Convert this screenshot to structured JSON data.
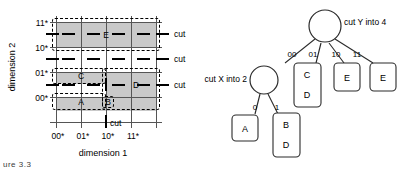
{
  "figure": {
    "caption_fragment": "ure 3.3"
  },
  "grid": {
    "ylabel": "dimension 2",
    "xlabel": "dimension 1",
    "yticks": [
      "11*",
      "10*",
      "01*",
      "00*"
    ],
    "xticks": [
      "00*",
      "01*",
      "10*",
      "11*"
    ],
    "regions": [
      {
        "letter": "E"
      },
      {
        "letter": "C"
      },
      {
        "letter": "A"
      },
      {
        "letter": "D"
      },
      {
        "letter": "B"
      }
    ],
    "cut_labels": {
      "right_top": "cut",
      "right_mid": "cut",
      "right_bottom": "cut",
      "bottom": "cut"
    },
    "colors": {
      "shade": "#c9c9c9",
      "gridline": "#555555",
      "ink": "#000000"
    }
  },
  "tree": {
    "root": {
      "annotation": "cut Y into 4"
    },
    "inner": {
      "annotation": "cut X into 2"
    },
    "root_edge_labels": [
      "00",
      "01",
      "10",
      "11"
    ],
    "inner_edge_labels": [
      "0",
      "1"
    ],
    "leaves": [
      {
        "id": "leaf-a",
        "lines": [
          "A"
        ]
      },
      {
        "id": "leaf-bd",
        "lines": [
          "B",
          "D"
        ]
      },
      {
        "id": "leaf-cd",
        "lines": [
          "C",
          "D"
        ]
      },
      {
        "id": "leaf-e1",
        "lines": [
          "E"
        ]
      },
      {
        "id": "leaf-e2",
        "lines": [
          "E"
        ]
      }
    ]
  }
}
